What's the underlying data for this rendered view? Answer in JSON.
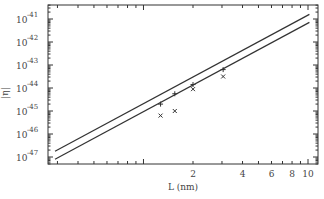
{
  "chart_data": {
    "type": "line",
    "title": "",
    "xlabel": "L (nm)",
    "ylabel": "|η|",
    "xscale": "log",
    "yscale": "log",
    "xlim": [
      0.26,
      11
    ],
    "ylim_exponents": [
      -47.3,
      -40.4
    ],
    "x_ticks": [
      {
        "value": 2,
        "label": "2"
      },
      {
        "value": 4,
        "label": "4"
      },
      {
        "value": 6,
        "label": "6"
      },
      {
        "value": 8,
        "label": "8"
      },
      {
        "value": 10,
        "label": "10"
      }
    ],
    "y_ticks": [
      {
        "exp": -41,
        "label_base": "10",
        "label_exp": "-41"
      },
      {
        "exp": -42,
        "label_base": "10",
        "label_exp": "-42"
      },
      {
        "exp": -43,
        "label_base": "10",
        "label_exp": "-43"
      },
      {
        "exp": -44,
        "label_base": "10",
        "label_exp": "-44"
      },
      {
        "exp": -45,
        "label_base": "10",
        "label_exp": "-45"
      },
      {
        "exp": -46,
        "label_base": "10",
        "label_exp": "-46"
      },
      {
        "exp": -47,
        "label_base": "10",
        "label_exp": "-47"
      }
    ],
    "series": [
      {
        "name": "upper curve",
        "kind": "line",
        "x": [
          0.29,
          10.2
        ],
        "log10_y": [
          -46.75,
          -40.8
        ]
      },
      {
        "name": "lower curve",
        "kind": "line",
        "x": [
          0.29,
          10.2
        ],
        "log10_y": [
          -47.1,
          -41.15
        ]
      },
      {
        "name": "plus markers",
        "kind": "scatter",
        "marker": "+",
        "x": [
          1.27,
          1.55,
          2.0,
          3.05
        ],
        "log10_y": [
          -44.7,
          -44.25,
          -43.85,
          -43.2
        ]
      },
      {
        "name": "cross markers",
        "kind": "scatter",
        "marker": "x",
        "x": [
          1.27,
          1.55,
          2.0,
          3.05
        ],
        "log10_y": [
          -45.2,
          -45.0,
          -44.05,
          -43.5
        ]
      }
    ],
    "grid": false,
    "legend": "none"
  }
}
